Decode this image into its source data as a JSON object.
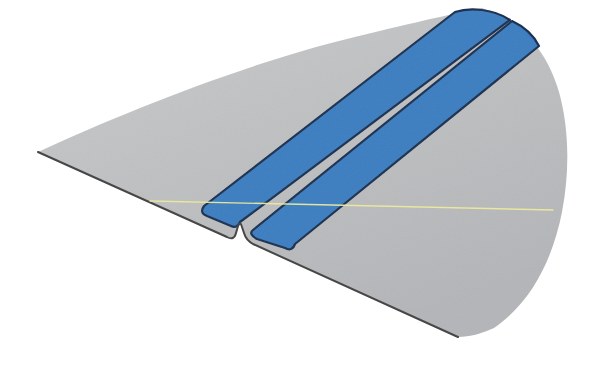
{
  "meta": {
    "canvas": {
      "width": 601,
      "height": 367
    },
    "background": "#ffffff"
  },
  "colors": {
    "surface_gray_light": "#c9cacb",
    "surface_gray_dark": "#b4b5b8",
    "trailing_edge_dark": "#454545",
    "strip_blue": "#3c7ec1",
    "strip_outline_navy": "#1d3150",
    "reference_yellow": "#edea9c"
  },
  "shapes": [
    {
      "name": "wing-surface",
      "type": "path",
      "d": "M 38 152 C 120 114 235 68 335 42 C 395 27 442 16 482 8 C 520 20 547 50 559 92 C 569 128 570 170 562 212 C 553 258 532 302 494 328 C 483 333 470 337 458 337 L 253 244 Q 246 240 244 233 L 242 227 Q 240 220 238 226 L 236 233 Q 234 241 227 237 L 38 152 Z",
      "fill": "url(#grayGrad)",
      "stroke": "none",
      "strokeWidth": 0
    },
    {
      "name": "strip-inboard",
      "type": "path",
      "d": "M 204 206 L 455 12 C 470 7 494 9 510 20 L 240 222 Q 237 229 231 226 L 207 216 Q 199 213 204 206 Z",
      "fill": "#3c7ec1",
      "stroke": "#1d3150",
      "strokeWidth": 2.2
    },
    {
      "name": "strip-outboard",
      "type": "path",
      "d": "M 253 230 L 512 21 C 525 27 534 36 539 46 L 295 244 Q 292 252 285 248 L 257 239 Q 248 234 253 230 Z",
      "fill": "#3c7ec1",
      "stroke": "#1d3150",
      "strokeWidth": 2.2
    },
    {
      "name": "trailing-edge-outline",
      "type": "path",
      "d": "M 38 152 L 227 237 Q 234 241 236 233 L 238 226 Q 240 220 242 227 L 244 233 Q 246 240 253 244 L 458 337",
      "fill": "none",
      "stroke": "#454545",
      "strokeWidth": 2
    },
    {
      "name": "reference-line",
      "type": "path",
      "d": "M 150 201 L 553 210",
      "fill": "none",
      "stroke": "#edea9c",
      "strokeWidth": 1.4,
      "opacity": 0.95
    },
    {
      "name": "grain-overlay",
      "type": "path",
      "d": "M 38 152 C 120 114 235 68 335 42 C 395 27 442 16 482 8 C 520 20 547 50 559 92 C 569 128 570 170 562 212 C 553 258 532 302 494 328 C 483 333 470 337 458 337 L 253 244 Q 246 240 244 233 L 242 227 Q 240 220 238 226 L 236 233 Q 234 241 227 237 L 38 152 Z",
      "fill": "#000000",
      "stroke": "none",
      "strokeWidth": 0,
      "opacity": 0.12,
      "filter": "url(#grain)"
    }
  ]
}
